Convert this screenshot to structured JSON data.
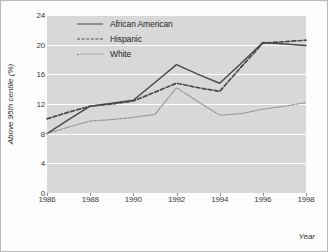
{
  "chart_data": {
    "type": "line",
    "title": "",
    "xlabel": "Year",
    "ylabel": "Above 95th centile (%)",
    "xlim": [
      1986,
      1998
    ],
    "ylim": [
      0,
      24
    ],
    "grid": true,
    "legend_position": "top-left inside plot",
    "x": [
      1986,
      1987,
      1988,
      1989,
      1990,
      1991,
      1992,
      1993,
      1994,
      1995,
      1996,
      1997,
      1998
    ],
    "x_tick_labels": [
      "1986",
      "1988",
      "1990",
      "1992",
      "1994",
      "1996",
      "1998"
    ],
    "x_ticks": [
      1986,
      1988,
      1990,
      1992,
      1994,
      1996,
      1998
    ],
    "y_ticks": [
      0,
      4,
      8,
      12,
      16,
      20,
      24
    ],
    "y_tick_labels": [
      "0",
      "4",
      "8",
      "12",
      "16",
      "20",
      "24"
    ],
    "series": [
      {
        "name": "African American",
        "style": "solid",
        "color": "#4a4a4a",
        "values": [
          8.0,
          9.9,
          11.7,
          12.1,
          12.5,
          14.9,
          17.3,
          16.0,
          14.8,
          17.5,
          20.3,
          20.1,
          19.9
        ]
      },
      {
        "name": "Hispanic",
        "style": "dashed",
        "color": "#4a4a4a",
        "values": [
          10.0,
          10.9,
          11.7,
          12.0,
          12.4,
          13.6,
          14.8,
          14.2,
          13.7,
          17.0,
          20.2,
          20.4,
          20.6
        ]
      },
      {
        "name": "White",
        "style": "dotted",
        "color": "#8a8a8a",
        "values": [
          8.0,
          8.9,
          9.7,
          9.9,
          10.2,
          10.6,
          14.2,
          12.3,
          10.5,
          10.7,
          11.3,
          11.7,
          12.2
        ]
      }
    ]
  },
  "legend": {
    "items": [
      {
        "label": "African American",
        "style": "solid"
      },
      {
        "label": "Hispanic",
        "style": "dashed"
      },
      {
        "label": "White",
        "style": "dotted"
      }
    ]
  },
  "axes": {
    "y_title": "Above 95th centile (%)",
    "x_title": "Year"
  }
}
